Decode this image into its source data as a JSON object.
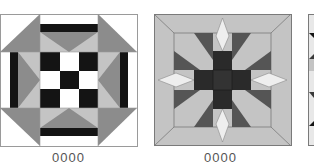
{
  "figure": {
    "colors": {
      "white": "#ffffff",
      "black": "#141414",
      "dark_grey": "#3a3a3a",
      "mid_grey": "#8c8c8c",
      "light_grey": "#c4c4c4",
      "pale_grey": "#e8e8e8",
      "outline": "#7a7a7a"
    },
    "blocks": [
      {
        "id": "block-1",
        "name": "nine-patch-star-block",
        "caption": "0000"
      },
      {
        "id": "block-2",
        "name": "cross-and-star-block",
        "caption": "0000"
      },
      {
        "id": "block-3",
        "name": "cropped-block",
        "caption": ""
      }
    ]
  }
}
